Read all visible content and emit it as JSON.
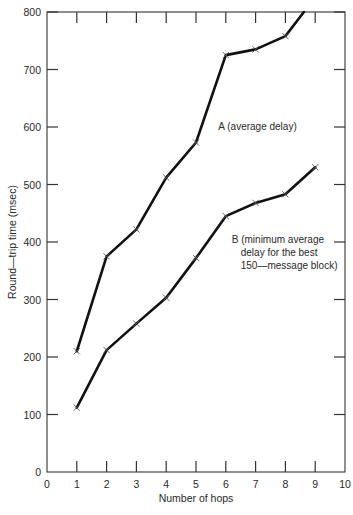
{
  "chart_data": {
    "type": "line",
    "title": "",
    "subtitle": "",
    "xlabel": "Number of hops",
    "ylabel": "Round—trip time (msec)",
    "xlim": [
      0,
      10
    ],
    "ylim": [
      0,
      800
    ],
    "xticks": [
      "0",
      "1",
      "2",
      "3",
      "4",
      "5",
      "6",
      "7",
      "8",
      "9",
      "10"
    ],
    "yticks": [
      "0",
      "100",
      "200",
      "300",
      "400",
      "500",
      "600",
      "700",
      "800"
    ],
    "grid": false,
    "legend_position": "inline-annotation",
    "marker": "x",
    "series": [
      {
        "name": "A",
        "label": "A  (average delay)",
        "x": [
          1,
          2,
          3,
          4,
          5,
          6,
          7,
          8,
          8.62
        ],
        "values": [
          210,
          375,
          422,
          512,
          573,
          725,
          735,
          758,
          800
        ]
      },
      {
        "name": "B",
        "label": "B  (minimum average delay for the best 150—message block)",
        "x": [
          1,
          2,
          3,
          4,
          5,
          6,
          7,
          8,
          9
        ],
        "values": [
          112,
          212,
          258,
          303,
          372,
          445,
          468,
          483,
          530
        ]
      }
    ],
    "annotations": [
      {
        "id": "label-a",
        "lines": [
          "A  (average delay)"
        ],
        "x": 5.75,
        "y": 595
      },
      {
        "id": "label-b",
        "lines": [
          "B  (minimum average",
          "delay for the best",
          "150—message block)"
        ],
        "x": 6.2,
        "y": 398
      }
    ]
  }
}
